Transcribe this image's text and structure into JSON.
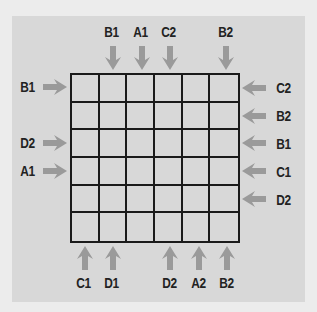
{
  "diagram": {
    "rows": 6,
    "cols": 6,
    "colors": {
      "background": "#ececec",
      "panel": "#d8d8d8",
      "grid_line": "#1a1a1a",
      "arrow": "#9a9a9a",
      "label": "#222222"
    },
    "top": [
      {
        "label": "B1",
        "col": 2
      },
      {
        "label": "A1",
        "col": 3
      },
      {
        "label": "C2",
        "col": 4
      },
      {
        "label": "B2",
        "col": 6
      }
    ],
    "bottom": [
      {
        "label": "C1",
        "col": 1
      },
      {
        "label": "D1",
        "col": 2
      },
      {
        "label": "D2",
        "col": 4
      },
      {
        "label": "A2",
        "col": 5
      },
      {
        "label": "B2",
        "col": 6
      }
    ],
    "left": [
      {
        "label": "B1",
        "row": 1
      },
      {
        "label": "D2",
        "row": 3
      },
      {
        "label": "A1",
        "row": 4
      }
    ],
    "right": [
      {
        "label": "C2",
        "row": 1
      },
      {
        "label": "B2",
        "row": 2
      },
      {
        "label": "B1",
        "row": 3
      },
      {
        "label": "C1",
        "row": 4
      },
      {
        "label": "D2",
        "row": 5
      }
    ]
  }
}
